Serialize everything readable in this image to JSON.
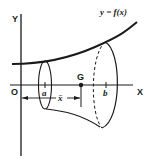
{
  "figure": {
    "colors": {
      "stroke": "#1a1a1a",
      "background": "#ffffff"
    },
    "labels": {
      "y_axis": "Y",
      "x_axis": "X",
      "origin": "O",
      "curve": "y = f(x)",
      "lower_bound": "a",
      "upper_bound": "b",
      "centroid": "G",
      "centroid_distance": "x̄"
    }
  }
}
